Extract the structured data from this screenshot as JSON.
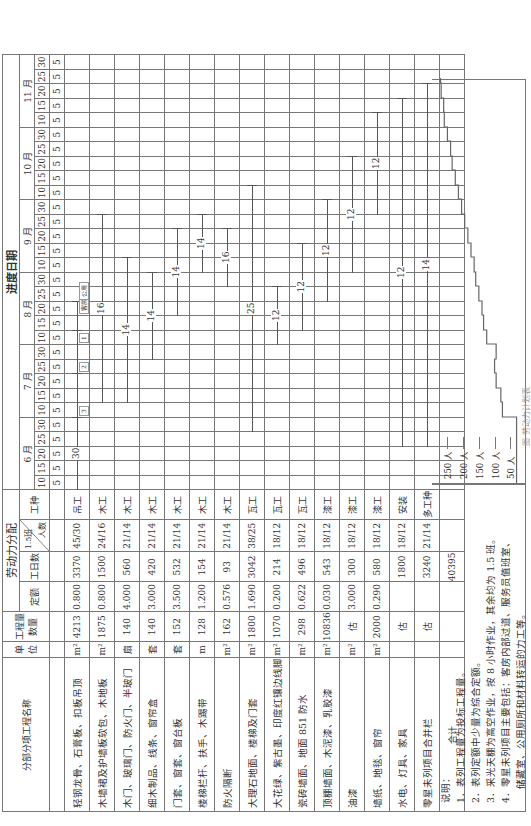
{
  "header": {
    "name_col": "分部分项工程名称",
    "unit_col": "单位",
    "qty_col": "工程量数量",
    "labor_group": "劳动力分配",
    "quota_col": "定额",
    "days_col": "工日数",
    "shift_col": "1.5班",
    "people_col": "人数",
    "trade_col": "工种",
    "schedule_group": "进度日期"
  },
  "months": [
    "6 月",
    "7 月",
    "8 月",
    "9 月",
    "10 月",
    "11 月"
  ],
  "day_marks": [
    "5",
    "10",
    "15",
    "20",
    "25",
    "30"
  ],
  "slot_value": "5",
  "rows": [
    {
      "name": "轻钢龙骨、石膏板、扣板吊顶",
      "unit": "m²",
      "qty": "4213",
      "quota": "0.800",
      "days": "3370",
      "ppl": "45/30",
      "trade": "吊工"
    },
    {
      "name": "木墙裙及护墙板软包、木地板",
      "unit": "m²",
      "qty": "1875",
      "quota": "0.800",
      "days": "1500",
      "ppl": "24/16",
      "trade": "木工"
    },
    {
      "name": "木门、玻璃门、防火门、半玻门",
      "unit": "扇",
      "qty": "140",
      "quota": "4.000",
      "days": "560",
      "ppl": "21/14",
      "trade": "木工"
    },
    {
      "name": "细木制品、线条、窗帘盒",
      "unit": "套",
      "qty": "140",
      "quota": "3.000",
      "days": "420",
      "ppl": "21/14",
      "trade": "木工"
    },
    {
      "name": "门套、窗套、窗台板",
      "unit": "套",
      "qty": "152",
      "quota": "3.500",
      "days": "532",
      "ppl": "21/14",
      "trade": "木工"
    },
    {
      "name": "楼梯栏杆、扶手、木踢带",
      "unit": "m",
      "qty": "128",
      "quota": "1.200",
      "days": "154",
      "ppl": "21/14",
      "trade": "木工"
    },
    {
      "name": "防火隔断",
      "unit": "m²",
      "qty": "162",
      "quota": "0.576",
      "days": "93",
      "ppl": "21/14",
      "trade": "木工"
    },
    {
      "name": "大理石地面、楼梯及门套",
      "unit": "m²",
      "qty": "1800",
      "quota": "1.690",
      "days": "3042",
      "ppl": "38/25",
      "trade": "瓦工"
    },
    {
      "name": "大花绿、紫古墨、印度红镶边线脚",
      "unit": "m²",
      "qty": "1070",
      "quota": "0.200",
      "days": "214",
      "ppl": "18/12",
      "trade": "瓦工"
    },
    {
      "name": "瓷砖墙面、地面 851 防水",
      "unit": "m²",
      "qty": "298",
      "quota": "0.622",
      "days": "496",
      "ppl": "18/12",
      "trade": "瓦工"
    },
    {
      "name": "顶棚墙面、木泥漆、乳胶漆",
      "unit": "m²",
      "qty": "10836",
      "quota": "0.030",
      "days": "543",
      "ppl": "18/12",
      "trade": "漆工"
    },
    {
      "name": "油漆",
      "unit": "m²",
      "qty": "估",
      "quota": "3.000",
      "days": "300",
      "ppl": "18/12",
      "trade": "漆工"
    },
    {
      "name": "墙纸、地毯、窗帘",
      "unit": "m²",
      "qty": "2000",
      "quota": "0.290",
      "days": "580",
      "ppl": "18/12",
      "trade": "漆工"
    },
    {
      "name": "水电、灯具、家具",
      "unit": "",
      "qty": "估",
      "quota": "",
      "days": "1800",
      "ppl": "18/12",
      "trade": "安装"
    },
    {
      "name": "零星未列项目合并栏",
      "unit": "",
      "qty": "估",
      "quota": "",
      "days": "3240",
      "ppl": "21/14",
      "trade": "多工种"
    }
  ],
  "total": {
    "label": "合计",
    "days": "40395"
  },
  "gantt": [
    {
      "row": 0,
      "segments": [
        {
          "from": 0,
          "to": 5,
          "label": "30"
        },
        {
          "from": 5,
          "to": 8,
          "label": ""
        },
        {
          "from": 8,
          "to": 11,
          "label": ""
        },
        {
          "from": 11,
          "to": 13,
          "label": ""
        }
      ],
      "tags": [
        "3",
        "2",
        "1",
        "客房",
        "公用"
      ]
    },
    {
      "row": 1,
      "segments": [
        {
          "from": 6,
          "to": 19,
          "label": "16"
        }
      ]
    },
    {
      "row": 2,
      "segments": [
        {
          "from": 6,
          "to": 16,
          "label": "14"
        }
      ]
    },
    {
      "row": 3,
      "segments": [
        {
          "from": 9,
          "to": 15,
          "label": "14"
        }
      ]
    },
    {
      "row": 4,
      "segments": [
        {
          "from": 12,
          "to": 18,
          "label": "14"
        }
      ]
    },
    {
      "row": 5,
      "segments": [
        {
          "from": 15,
          "to": 19,
          "label": "14"
        }
      ]
    },
    {
      "row": 6,
      "segments": [
        {
          "from": 14,
          "to": 18,
          "label": "16"
        }
      ]
    },
    {
      "row": 7,
      "segments": [
        {
          "from": 4,
          "to": 21,
          "label": "25"
        }
      ]
    },
    {
      "row": 8,
      "segments": [
        {
          "from": 10,
          "to": 14,
          "label": "12"
        }
      ]
    },
    {
      "row": 9,
      "segments": [
        {
          "from": 11,
          "to": 17,
          "label": "12"
        }
      ]
    },
    {
      "row": 10,
      "segments": [
        {
          "from": 13,
          "to": 20,
          "label": "12"
        }
      ]
    },
    {
      "row": 11,
      "segments": [
        {
          "from": 15,
          "to": 23,
          "label": "12"
        }
      ]
    },
    {
      "row": 12,
      "segments": [
        {
          "from": 19,
          "to": 26,
          "label": "12"
        }
      ]
    },
    {
      "row": 13,
      "segments": [
        {
          "from": 3,
          "to": 27,
          "label": "12"
        }
      ]
    },
    {
      "row": 14,
      "segments": [
        {
          "from": 3,
          "to": 28,
          "label": "14"
        }
      ]
    }
  ],
  "notes": {
    "title": "说明：",
    "items": [
      "1．表列工程量为投标工程量。",
      "2．表列定额中少量为综合定额。",
      "3．采光天棚为高空作业，按 8 小时作业，其余均为 1.5 班。",
      "4．零星未列项目主要包括：客房内部过道、服务员值班室、",
      "储藏室、公用厕所和材料转运的力工等。"
    ]
  },
  "histogram": {
    "y_labels": [
      "250 人",
      "200 人",
      "150 人",
      "100 人",
      "50 人"
    ],
    "y_values": [
      250,
      200,
      150,
      100,
      50
    ],
    "people_by_slot": [
      30,
      30,
      30,
      30,
      30,
      75,
      80,
      95,
      100,
      95,
      125,
      135,
      140,
      150,
      160,
      165,
      175,
      185,
      195,
      205,
      215,
      225,
      235,
      240,
      250,
      260,
      262,
      270,
      272,
      275
    ]
  },
  "caption": "图 劳动力计划表"
}
